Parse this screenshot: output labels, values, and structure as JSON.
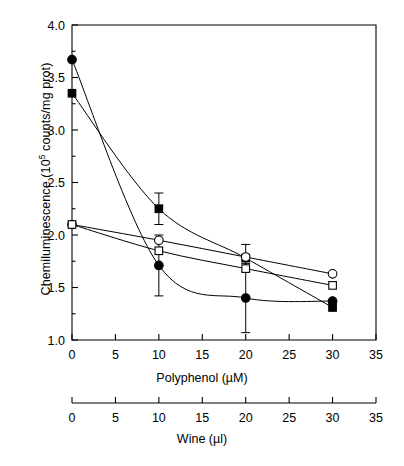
{
  "chart_data": {
    "type": "line",
    "title": "",
    "ylabel": "Chemiluminescence (10^5 counts/mg prot)",
    "ylabel_text": "Chemiluminescence (10",
    "ylabel_sup": "5",
    "ylabel_tail": " counts/mg prot)",
    "xlabel": "Polyphenol (µM)",
    "xlabel_secondary": "Wine (µl)",
    "ylim": [
      1.0,
      4.0
    ],
    "xlim": [
      0,
      35
    ],
    "yticks": [
      1.0,
      1.5,
      2.0,
      2.5,
      3.0,
      3.5,
      4.0
    ],
    "ytick_labels": [
      "1.0",
      "1.5",
      "2.0",
      "2.5",
      "3.0",
      "3.5",
      "4.0"
    ],
    "yminor_ticks": [
      1.25,
      1.75,
      2.25,
      2.75,
      3.25,
      3.75
    ],
    "xticks": [
      0,
      5,
      10,
      15,
      20,
      25,
      30,
      35
    ],
    "xtick_labels": [
      "0",
      "5",
      "10",
      "15",
      "20",
      "25",
      "30",
      "35"
    ],
    "xticks_secondary": [
      0,
      5,
      10,
      15,
      20,
      25,
      30,
      35
    ],
    "xtick_labels_secondary": [
      "0",
      "5",
      "10",
      "15",
      "20",
      "25",
      "30",
      "35"
    ],
    "grid": false,
    "legend": "none",
    "line_color": "#000000",
    "marker_fill_open": "#ffffff",
    "marker_fill_closed": "#000000",
    "series": [
      {
        "name": "filled-circle",
        "marker": "filled-circle",
        "x": [
          0,
          10,
          20,
          30
        ],
        "values": [
          3.67,
          1.71,
          1.4,
          1.37
        ],
        "errors": [
          0.0,
          0.29,
          0.33,
          0.0
        ]
      },
      {
        "name": "filled-square",
        "marker": "filled-square",
        "x": [
          0,
          10,
          20,
          30
        ],
        "values": [
          3.35,
          2.25,
          1.78,
          1.31
        ],
        "errors": [
          0.0,
          0.15,
          0.13,
          0.0
        ]
      },
      {
        "name": "open-circle",
        "marker": "open-circle",
        "x": [
          0,
          10,
          20,
          30
        ],
        "values": [
          2.1,
          1.95,
          1.79,
          1.63
        ],
        "errors": [
          0.0,
          0.0,
          0.0,
          0.0
        ]
      },
      {
        "name": "open-square",
        "marker": "open-square",
        "x": [
          0,
          10,
          20,
          30
        ],
        "values": [
          2.1,
          1.85,
          1.68,
          1.52
        ],
        "errors": [
          0.0,
          0.0,
          0.0,
          0.0
        ]
      }
    ]
  },
  "axes": {
    "plot_left": 72,
    "plot_right": 376,
    "plot_top": 25,
    "plot_bottom": 340,
    "secondary_axis_y": 403
  }
}
